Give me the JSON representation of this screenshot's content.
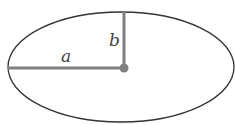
{
  "diagram": {
    "type": "ellipse",
    "labels": {
      "semi_major": "a",
      "semi_minor": "b"
    },
    "colors": {
      "outline": "#333333",
      "axis": "#808080",
      "center_dot": "#808080"
    }
  }
}
